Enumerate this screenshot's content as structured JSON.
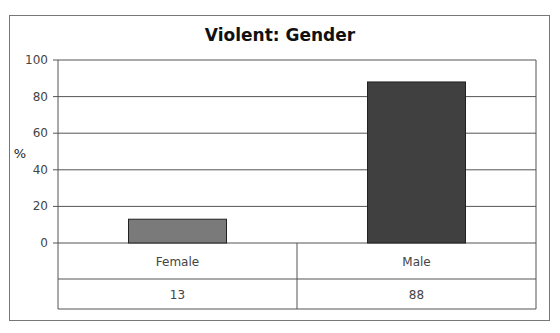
{
  "caption_cut": "Stat/Table: Violent offences by gender",
  "chart_data": {
    "type": "bar",
    "title": "Violent: Gender",
    "xlabel": "",
    "ylabel": "%",
    "categories": [
      "Female",
      "Male"
    ],
    "values": [
      13,
      88
    ],
    "table_values": [
      "13",
      "88"
    ],
    "ylim": [
      0,
      100
    ],
    "yticks": [
      0,
      20,
      40,
      60,
      80,
      100
    ],
    "grid": true,
    "legend": "none",
    "colors": [
      "#7a7a7a",
      "#404040"
    ]
  }
}
